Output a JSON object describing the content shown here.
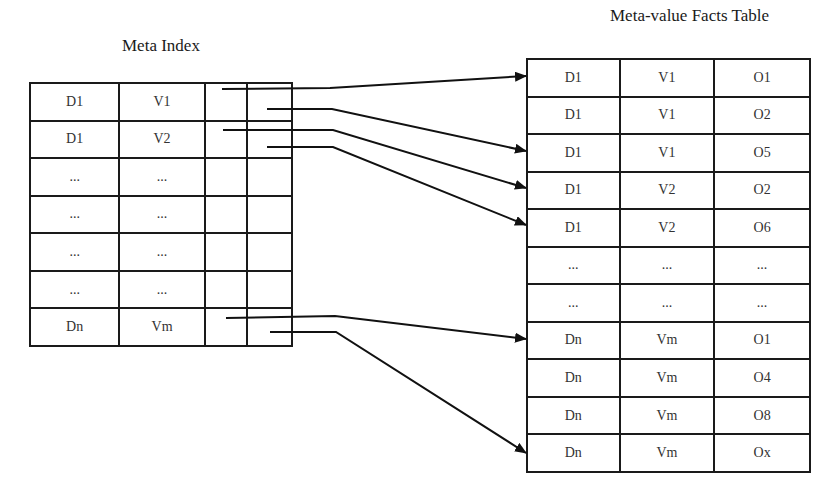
{
  "meta_index": {
    "title": "Meta Index",
    "rows": [
      {
        "d": "D1",
        "v": "V1"
      },
      {
        "d": "D1",
        "v": "V2"
      },
      {
        "d": "...",
        "v": "..."
      },
      {
        "d": "...",
        "v": "..."
      },
      {
        "d": "...",
        "v": "..."
      },
      {
        "d": "...",
        "v": "..."
      },
      {
        "d": "Dn",
        "v": "Vm"
      }
    ]
  },
  "facts_table": {
    "title": "Meta-value Facts Table",
    "rows": [
      {
        "d": "D1",
        "v": "V1",
        "o": "O1"
      },
      {
        "d": "D1",
        "v": "V1",
        "o": "O2"
      },
      {
        "d": "D1",
        "v": "V1",
        "o": "O5"
      },
      {
        "d": "D1",
        "v": "V2",
        "o": "O2"
      },
      {
        "d": "D1",
        "v": "V2",
        "o": "O6"
      },
      {
        "d": "...",
        "v": "...",
        "o": "..."
      },
      {
        "d": "...",
        "v": "...",
        "o": "..."
      },
      {
        "d": "Dn",
        "v": "Vm",
        "o": "O1"
      },
      {
        "d": "Dn",
        "v": "Vm",
        "o": "O4"
      },
      {
        "d": "Dn",
        "v": "Vm",
        "o": "O8"
      },
      {
        "d": "Dn",
        "v": "Vm",
        "o": "Ox"
      }
    ]
  },
  "pointers": [
    {
      "from_row": 0,
      "from_col": "start",
      "to_row": 0
    },
    {
      "from_row": 0,
      "from_col": "end",
      "to_row": 2
    },
    {
      "from_row": 1,
      "from_col": "start",
      "to_row": 3
    },
    {
      "from_row": 1,
      "from_col": "end",
      "to_row": 4
    },
    {
      "from_row": 6,
      "from_col": "start",
      "to_row": 7
    },
    {
      "from_row": 6,
      "from_col": "end",
      "to_row": 10
    }
  ]
}
